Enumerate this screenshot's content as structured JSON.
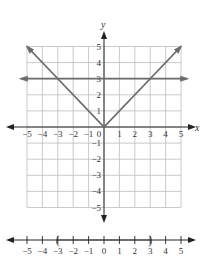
{
  "chart_data": [
    {
      "type": "line",
      "title": "",
      "xlabel": "x",
      "ylabel": "y",
      "xlim": [
        -5,
        5
      ],
      "ylim": [
        -5,
        5
      ],
      "grid": true,
      "x_ticks": [
        -5,
        -4,
        -3,
        -2,
        -1,
        0,
        1,
        2,
        3,
        4,
        5
      ],
      "y_ticks": [
        -5,
        -4,
        -3,
        -2,
        -1,
        1,
        2,
        3,
        4,
        5
      ],
      "series": [
        {
          "name": "y = |x|",
          "x": [
            -5,
            0,
            5
          ],
          "y": [
            5,
            0,
            5
          ],
          "color": "#6b6b6b"
        },
        {
          "name": "y = 3",
          "x": [
            -5,
            5
          ],
          "y": [
            3,
            3
          ],
          "color": "#6b6b6b"
        }
      ],
      "intersections": [
        [
          -3,
          3
        ],
        [
          3,
          3
        ]
      ]
    },
    {
      "type": "number_line",
      "xlim": [
        -5,
        5
      ],
      "ticks": [
        -5,
        -4,
        -3,
        -2,
        -1,
        0,
        1,
        2,
        3,
        4,
        5
      ],
      "interval": {
        "left": -3,
        "right": 3,
        "left_open": true,
        "right_open": true,
        "notation": "(-3, 3)"
      }
    }
  ],
  "labels": {
    "x_axis": "x",
    "y_axis": "y",
    "x_ticks": [
      "−5",
      "−4",
      "−3",
      "−2",
      "−1",
      "0",
      "1",
      "2",
      "3",
      "4",
      "5"
    ],
    "y_ticks_pos": [
      "1",
      "2",
      "3",
      "4",
      "5"
    ],
    "y_ticks_neg": [
      "−1",
      "−2",
      "−3",
      "−4",
      "−5"
    ],
    "numberline_ticks": [
      "−5",
      "−4",
      "−3",
      "−2",
      "−1",
      "0",
      "1",
      "2",
      "3",
      "4",
      "5"
    ],
    "left_paren": "(",
    "right_paren": ")"
  },
  "colors": {
    "grid": "#bdbdbd",
    "axis": "#222222",
    "graph": "#6b6b6b",
    "text": "#333333"
  }
}
